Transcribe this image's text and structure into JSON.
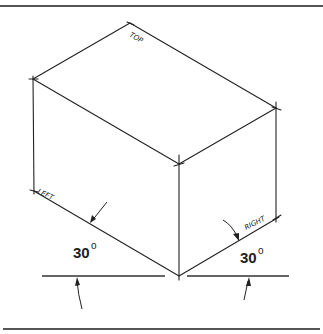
{
  "figure": {
    "face_labels": {
      "top": "TOP",
      "left": "LEFT",
      "right": "RIGHT"
    },
    "angles": {
      "left": {
        "value": "30",
        "unit": "o"
      },
      "right": {
        "value": "30",
        "unit": "o"
      }
    },
    "colors": {
      "line": "#222222",
      "rule": "#555555",
      "background": "#ffffff"
    }
  }
}
